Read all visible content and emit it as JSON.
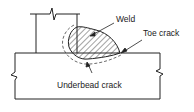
{
  "diagram": {
    "labels": {
      "weld": "Weld",
      "toe_crack": "Toe crack",
      "underbead_crack": "Underbead crack"
    },
    "colors": {
      "line": "#222222",
      "hatch": "#333333",
      "background": "#ffffff"
    }
  }
}
